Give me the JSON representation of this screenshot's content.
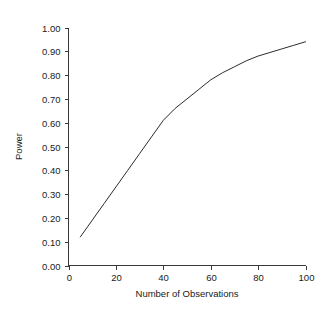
{
  "chart_data": {
    "type": "line",
    "title": "",
    "subtitle": "",
    "xlabel": "Number of Observations",
    "ylabel": "Power",
    "xlim": [
      0,
      100
    ],
    "ylim": [
      0.0,
      1.0
    ],
    "grid": false,
    "legend": false,
    "legend_position": "none",
    "line_color": "#2b2b2b",
    "background_color": "#ffffff",
    "axis_color": "#3a3a3a",
    "x_ticks": [
      0,
      20,
      40,
      60,
      80,
      100
    ],
    "x_tick_labels": [
      "0",
      "20",
      "40",
      "60",
      "80",
      "100"
    ],
    "y_ticks": [
      0.0,
      0.1,
      0.2,
      0.3,
      0.4,
      0.5,
      0.6,
      0.7,
      0.8,
      0.9,
      1.0
    ],
    "y_tick_labels": [
      "0.00",
      "0.10",
      "0.20",
      "0.30",
      "0.40",
      "0.50",
      "0.60",
      "0.70",
      "0.80",
      "0.90",
      "1.00"
    ],
    "series": [
      {
        "name": "Power",
        "x": [
          5,
          10,
          15,
          20,
          25,
          30,
          35,
          40,
          45,
          50,
          55,
          60,
          65,
          70,
          75,
          80,
          85,
          90,
          95,
          100
        ],
        "y": [
          0.12,
          0.19,
          0.26,
          0.33,
          0.4,
          0.47,
          0.54,
          0.61,
          0.66,
          0.7,
          0.74,
          0.78,
          0.81,
          0.835,
          0.86,
          0.88,
          0.895,
          0.91,
          0.925,
          0.94
        ]
      }
    ]
  },
  "axes": {
    "x_title": "Number of Observations",
    "y_title": "Power"
  }
}
